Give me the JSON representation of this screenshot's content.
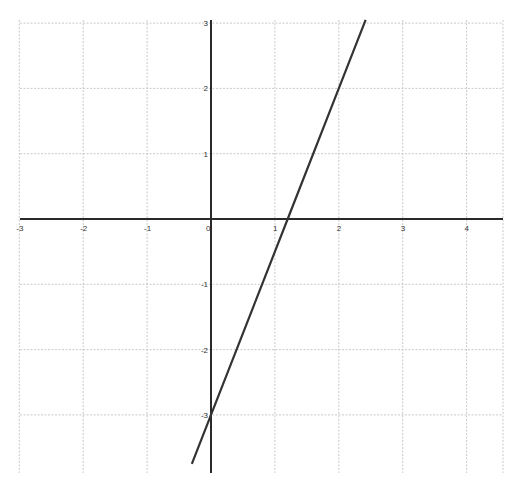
{
  "chart_data": {
    "type": "line",
    "title": "",
    "xlabel": "",
    "ylabel": "",
    "xlim": [
      -3,
      4.6
    ],
    "ylim": [
      -3.85,
      3.05
    ],
    "grid": true,
    "x_ticks": [
      -3,
      -2,
      -1,
      0,
      1,
      2,
      3,
      4
    ],
    "y_ticks": [
      -3,
      -2,
      -1,
      1,
      2,
      3
    ],
    "x_tick_labels": [
      "-3",
      "-2",
      "-1",
      "0",
      "1",
      "2",
      "3",
      "4"
    ],
    "y_tick_labels": [
      "-3",
      "-2",
      "-1",
      "1",
      "2",
      "3"
    ],
    "series": [
      {
        "name": "y = 2.5x - 3",
        "equation": "y = 2.5x - 3",
        "slope": 2.5,
        "intercept": -3,
        "x_intercept": 1.2,
        "x": [
          -0.3,
          0,
          1.2,
          2,
          2.42
        ],
        "y": [
          -3.75,
          -3,
          0,
          2,
          3.05
        ],
        "color": "#333333"
      }
    ],
    "legend": null
  },
  "layout": {
    "origin_px": [
      211,
      219
    ],
    "unit_x_px": 63.9,
    "unit_y_px": 65.3,
    "plot_left_px": 20,
    "plot_right_px": 503,
    "plot_top_px": 20,
    "plot_bottom_px": 473
  },
  "colors": {
    "grid": "#bdbdbd",
    "axis": "#2a2a2a",
    "line": "#333333",
    "background": "#ffffff"
  }
}
